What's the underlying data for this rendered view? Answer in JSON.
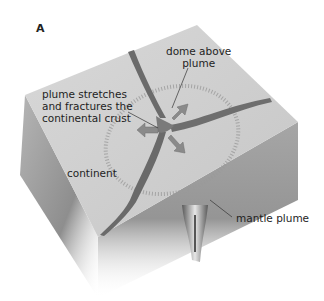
{
  "figure": {
    "panel_label": "A",
    "labels": {
      "dome": [
        "dome above",
        "plume"
      ],
      "stretch": [
        "plume stretches",
        "and fractures the",
        "continental crust"
      ],
      "continent": "continent",
      "mantle": "mantle plume"
    },
    "colors": {
      "top_face": "#d2d2d2",
      "side_left": "#a8a8a8",
      "side_right": "#9c9c9c",
      "rift": "#6b6b6b",
      "arrow": "#8a8a8a",
      "text": "#1e1e1e"
    }
  }
}
